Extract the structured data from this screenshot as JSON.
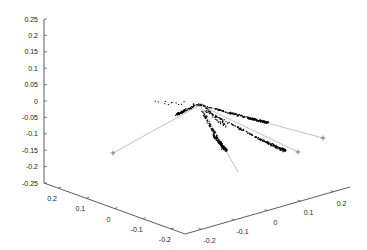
{
  "chart_data": {
    "type": "scatter",
    "dimensions": 3,
    "title": "",
    "xlabel": "",
    "ylabel": "",
    "zlabel": "",
    "grid": false,
    "legend": null,
    "z_axis": {
      "range": [
        -0.25,
        0.25
      ],
      "ticks": [
        "0.25",
        "0.2",
        "0.15",
        "0.1",
        "0.05",
        "0",
        "-0.05",
        "-0.1",
        "-0.15",
        "-0.2",
        "-0.25"
      ]
    },
    "left_base_axis": {
      "range": [
        0.25,
        -0.25
      ],
      "ticks": [
        "0.2",
        "0.1",
        "0",
        "-0.1",
        "-0.2"
      ]
    },
    "right_base_axis": {
      "range": [
        -0.25,
        0.25
      ],
      "ticks": [
        "-0.2",
        "-0.1",
        "0",
        "0.1",
        "0.2"
      ]
    },
    "series": [
      {
        "name": "point-cloud",
        "marker": ".",
        "color": "#000000",
        "description": "Dense black point clusters forming three elongated streaks radiating from a common origin near (0,0,0)"
      },
      {
        "name": "direction-lines",
        "marker": "+",
        "color": "#9a9a9a",
        "lines": [
          {
            "label": "line-1",
            "from_px": [
              200,
              105
            ],
            "to_px": [
              113,
              153
            ]
          },
          {
            "label": "line-2",
            "from_px": [
              200,
              105
            ],
            "to_px": [
              323,
              138
            ]
          },
          {
            "label": "line-3",
            "from_px": [
              200,
              105
            ],
            "to_px": [
              298,
              152
            ]
          },
          {
            "label": "line-4",
            "from_px": [
              200,
              105
            ],
            "to_px": [
              238,
              172
            ]
          }
        ]
      }
    ]
  },
  "axes": {
    "colors": {
      "axis": "#333333",
      "points": "#000000",
      "lines": "#a0a0a0"
    }
  }
}
